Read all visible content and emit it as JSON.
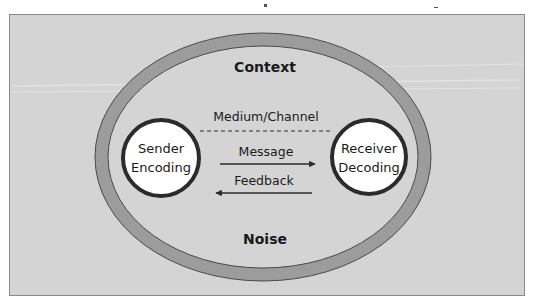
{
  "diagram": {
    "title": "",
    "colors": {
      "background": "#d4d4d4",
      "frame_border": "#8a8a8a",
      "ring_fill": "#9c9c9c",
      "ring_stroke": "#4a4a4a",
      "node_fill": "#ffffff",
      "node_stroke": "#2b2b2b",
      "text": "#1a1a1a"
    },
    "outer_labels": {
      "top": "Context",
      "bottom": "Noise"
    },
    "channel": {
      "label": "Medium/Channel",
      "style": "dashed-line"
    },
    "nodes": [
      {
        "id": "sender",
        "line1": "Sender",
        "line2": "Encoding"
      },
      {
        "id": "receiver",
        "line1": "Receiver",
        "line2": "Decoding"
      }
    ],
    "edges": [
      {
        "label": "Message",
        "from": "sender",
        "to": "receiver",
        "direction": "right"
      },
      {
        "label": "Feedback",
        "from": "receiver",
        "to": "sender",
        "direction": "left"
      }
    ]
  }
}
